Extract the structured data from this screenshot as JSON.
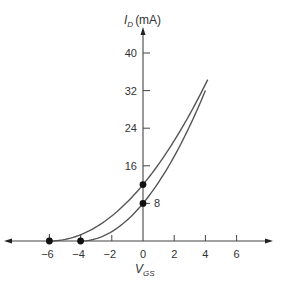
{
  "chart_data": {
    "type": "line",
    "title": "",
    "xlabel": "V_GS",
    "xlabel_main": "V",
    "xlabel_sub": "GS",
    "ylabel": "I_D (mA)",
    "ylabel_main": "I",
    "ylabel_sub": "D",
    "ylabel_unit": "(mA)",
    "xlim": [
      -6,
      6
    ],
    "ylim": [
      0,
      40
    ],
    "x_ticks": [
      -6,
      -4,
      -2,
      0,
      2,
      4,
      6
    ],
    "x_tick_labels": [
      "−6",
      "−4",
      "−2",
      "0",
      "2",
      "4",
      "6"
    ],
    "y_ticks": [
      8,
      16,
      24,
      32,
      40
    ],
    "y_tick_labels": [
      "8",
      "16",
      "24",
      "32",
      "40"
    ],
    "grid": false,
    "series": [
      {
        "name": "Upper curve (IDSS = 12 mA, VP = -6 V)",
        "x": [
          -6,
          -5,
          -4,
          -3,
          -2,
          -1,
          0,
          1,
          2,
          3,
          4
        ],
        "values": [
          0,
          0.33,
          1.33,
          3,
          5.33,
          8.33,
          12,
          16.33,
          21.33,
          27,
          33.33
        ],
        "points_marked": [
          {
            "x": -6,
            "y": 0
          },
          {
            "x": 0,
            "y": 12
          }
        ]
      },
      {
        "name": "Lower curve (IDSS = 8 mA, VP = -4 V)",
        "x": [
          -4,
          -3,
          -2,
          -1,
          0,
          1,
          2,
          3,
          4
        ],
        "values": [
          0,
          0.5,
          2,
          4.5,
          8,
          12.5,
          18,
          24.5,
          32
        ],
        "points_marked": [
          {
            "x": -4,
            "y": 0
          },
          {
            "x": 0,
            "y": 8
          }
        ]
      }
    ],
    "annotations": [
      {
        "text": "8",
        "x": 0,
        "y": 8,
        "position": "right of y-axis"
      }
    ]
  }
}
